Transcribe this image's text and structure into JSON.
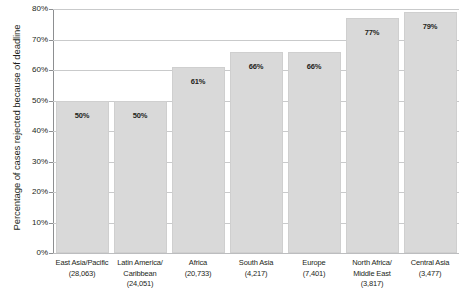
{
  "chart_data": {
    "type": "bar",
    "title": "",
    "xlabel": "",
    "ylabel": "Percentage of cases rejected because of deadline",
    "ylim": [
      0,
      80
    ],
    "grid": true,
    "legend": "none",
    "categories": [
      "East Asia/Pacific (28,063)",
      "Latin America/Caribbean (24,051)",
      "Africa (20,733)",
      "South Asia (4,217)",
      "Europe (7,401)",
      "North Africa/Middle East (3,817)",
      "Central Asia (3,477)"
    ],
    "category_lines": [
      [
        "East Asia/Pacific",
        "(28,063)"
      ],
      [
        "Latin America/",
        "Caribbean (24,051)"
      ],
      [
        "Africa",
        "(20,733)"
      ],
      [
        "South Asia",
        "(4,217)"
      ],
      [
        "Europe",
        "(7,401)"
      ],
      [
        "North Africa/",
        "Middle East (3,817)"
      ],
      [
        "Central Asia",
        "(3,477)"
      ]
    ],
    "values": [
      50,
      50,
      61,
      66,
      66,
      77,
      79
    ],
    "value_labels": [
      "50%",
      "50%",
      "61%",
      "66%",
      "66%",
      "77%",
      "79%"
    ],
    "ytick_values": [
      0,
      10,
      20,
      30,
      40,
      50,
      60,
      70,
      80
    ],
    "ytick_labels": [
      "0%",
      "10%",
      "20%",
      "30%",
      "40%",
      "50%",
      "60%",
      "70%",
      "80%"
    ],
    "bar_color": "#d9d9d9",
    "bar_border_color": "#cfcfcf",
    "gridline_color": "#c9cacb",
    "axis_color": "#8d8f91",
    "text_color": "#231f20"
  }
}
